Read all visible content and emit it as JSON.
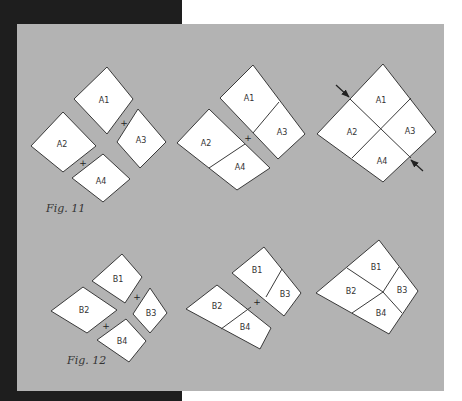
{
  "colors": {
    "dark_band": "#1e1e1e",
    "panel": "#b3b3b3",
    "piece_fill": "#ffffff",
    "stroke": "#3a3a3a",
    "background": "#ffffff"
  },
  "figures": [
    {
      "caption": "Fig. 11",
      "caption_pos": [
        46,
        212
      ],
      "steps": [
        {
          "name": "separate-pieces",
          "pieces": [
            {
              "label": "A1",
              "points": [
                [
                  107,
                  67
                ],
                [
                  133,
                  99
                ],
                [
                  107,
                  134
                ],
                [
                  74,
                  99
                ]
              ],
              "label_pos": [
                104,
                100
              ]
            },
            {
              "label": "A3",
              "points": [
                [
                  138,
                  109
                ],
                [
                  166,
                  142
                ],
                [
                  140,
                  168
                ],
                [
                  117,
                  142
                ]
              ],
              "label_pos": [
                141,
                140
              ]
            },
            {
              "label": "A2",
              "points": [
                [
                  63,
                  112
                ],
                [
                  96,
                  146
                ],
                [
                  63,
                  172
                ],
                [
                  31,
                  146
                ]
              ],
              "label_pos": [
                62,
                144
              ]
            },
            {
              "label": "A4",
              "points": [
                [
                  103,
                  154
                ],
                [
                  130,
                  179
                ],
                [
                  103,
                  202
                ],
                [
                  72,
                  178
                ]
              ],
              "label_pos": [
                101,
                181
              ]
            }
          ],
          "dividers": [],
          "plus_signs": [
            [
              124,
              123
            ],
            [
              83,
              163
            ]
          ]
        },
        {
          "name": "joined-pairs",
          "pieces": [
            {
              "label": "",
              "points": [
                [
                  253,
                  65
                ],
                [
                  305,
                  134
                ],
                [
                  278,
                  159
                ],
                [
                  220,
                  98
                ]
              ],
              "label_pos": [
                0,
                0
              ]
            },
            {
              "label": "",
              "points": [
                [
                  209,
                  109
                ],
                [
                  270,
                  168
                ],
                [
                  237,
                  190
                ],
                [
                  177,
                  143
                ]
              ],
              "label_pos": [
                0,
                0
              ]
            }
          ],
          "dividers": [
            [
              [
                253,
                133
              ],
              [
                279,
                102
              ]
            ],
            [
              [
                209,
                168
              ],
              [
                245,
                144
              ]
            ]
          ],
          "labels": [
            {
              "text": "A1",
              "pos": [
                249,
                98
              ]
            },
            {
              "text": "A3",
              "pos": [
                282,
                132
              ]
            },
            {
              "text": "A2",
              "pos": [
                206,
                143
              ]
            },
            {
              "text": "A4",
              "pos": [
                240,
                167
              ]
            }
          ],
          "plus_signs": [
            [
              248,
              138
            ]
          ]
        },
        {
          "name": "completed-block",
          "pieces": [
            {
              "label": "",
              "points": [
                [
                  383,
                  64
                ],
                [
                  436,
                  132
                ],
                [
                  383,
                  182
                ],
                [
                  317,
                  134
                ]
              ],
              "label_pos": [
                0,
                0
              ]
            }
          ],
          "dividers": [
            [
              [
                350,
                99
              ],
              [
                411,
                158
              ]
            ],
            [
              [
                411,
                98
              ],
              [
                352,
                158
              ]
            ]
          ],
          "labels": [
            {
              "text": "A1",
              "pos": [
                381,
                100
              ]
            },
            {
              "text": "A3",
              "pos": [
                410,
                131
              ]
            },
            {
              "text": "A2",
              "pos": [
                352,
                132
              ]
            },
            {
              "text": "A4",
              "pos": [
                382,
                161
              ]
            }
          ],
          "arrows": [
            {
              "from": [
                336,
                85
              ],
              "to": [
                349,
                97
              ]
            },
            {
              "from": [
                423,
                171
              ],
              "to": [
                411,
                160
              ]
            }
          ],
          "plus_signs": []
        }
      ]
    },
    {
      "caption": "Fig. 12",
      "caption_pos": [
        67,
        364
      ],
      "steps": [
        {
          "name": "separate-pieces",
          "pieces": [
            {
              "label": "B1",
              "points": [
                [
                  122,
                  254
                ],
                [
                  142,
                  277
                ],
                [
                  125,
                  303
                ],
                [
                  92,
                  281
                ]
              ],
              "label_pos": [
                118,
                279
              ]
            },
            {
              "label": "B3",
              "points": [
                [
                  150,
                  288
                ],
                [
                  167,
                  313
                ],
                [
                  150,
                  333
                ],
                [
                  133,
                  314
                ]
              ],
              "label_pos": [
                151,
                313
              ]
            },
            {
              "label": "B2",
              "points": [
                [
                  83,
                  287
                ],
                [
                  117,
                  310
                ],
                [
                  87,
                  333
                ],
                [
                  51,
                  311
                ]
              ],
              "label_pos": [
                84,
                310
              ]
            },
            {
              "label": "B4",
              "points": [
                [
                  126,
                  319
                ],
                [
                  146,
                  341
                ],
                [
                  129,
                  362
                ],
                [
                  97,
                  340
                ]
              ],
              "label_pos": [
                122,
                341
              ]
            }
          ],
          "dividers": [],
          "plus_signs": [
            [
              137,
              297
            ],
            [
              106,
              326
            ]
          ]
        },
        {
          "name": "joined-pairs",
          "pieces": [
            {
              "label": "",
              "points": [
                [
                  264,
                  247
                ],
                [
                  301,
                  293
                ],
                [
                  284,
                  316
                ],
                [
                  232,
                  273
                ]
              ],
              "label_pos": [
                0,
                0
              ]
            },
            {
              "label": "",
              "points": [
                [
                  217,
                  285
                ],
                [
                  271,
                  328
                ],
                [
                  260,
                  349
                ],
                [
                  186,
                  309
                ]
              ],
              "label_pos": [
                0,
                0
              ]
            }
          ],
          "dividers": [
            [
              [
                266,
                297
              ],
              [
                282,
                269
              ]
            ],
            [
              [
                221,
                329
              ],
              [
                251,
                307
              ]
            ]
          ],
          "labels": [
            {
              "text": "B1",
              "pos": [
                257,
                270
              ]
            },
            {
              "text": "B3",
              "pos": [
                285,
                294
              ]
            },
            {
              "text": "B2",
              "pos": [
                217,
                306
              ]
            },
            {
              "text": "B4",
              "pos": [
                245,
                327
              ]
            }
          ],
          "plus_signs": [
            [
              257,
              302
            ]
          ]
        },
        {
          "name": "completed-block",
          "pieces": [
            {
              "label": "",
              "points": [
                [
                  379,
                  240
                ],
                [
                  418,
                  291
                ],
                [
                  389,
                  334
                ],
                [
                  316,
                  293
                ]
              ],
              "label_pos": [
                0,
                0
              ]
            }
          ],
          "dividers": [
            [
              [
                347,
                268
              ],
              [
                383,
                292
              ],
              [
                402,
                313
              ]
            ],
            [
              [
                399,
                267
              ],
              [
                383,
                292
              ],
              [
                352,
                313
              ]
            ]
          ],
          "labels": [
            {
              "text": "B1",
              "pos": [
                376,
                267
              ]
            },
            {
              "text": "B3",
              "pos": [
                402,
                290
              ]
            },
            {
              "text": "B2",
              "pos": [
                351,
                291
              ]
            },
            {
              "text": "B4",
              "pos": [
                381,
                313
              ]
            }
          ],
          "plus_signs": []
        }
      ]
    }
  ]
}
